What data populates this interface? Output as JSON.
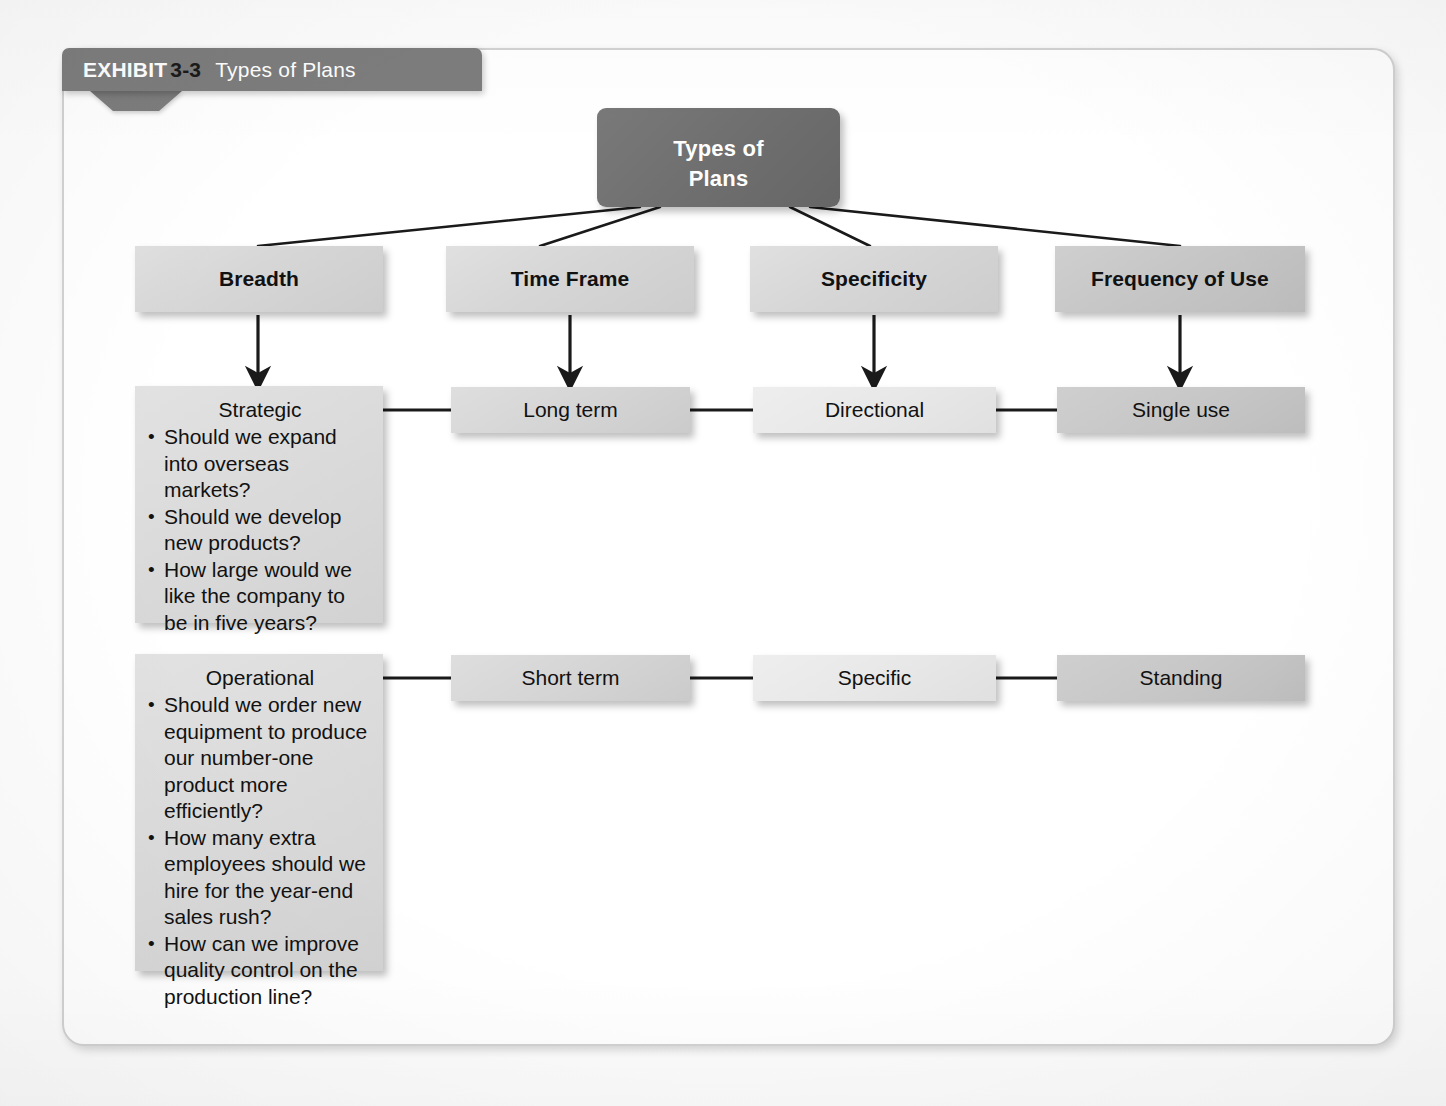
{
  "exhibit": {
    "label": "EXHIBIT",
    "number": "3-3",
    "title": "Types of Plans"
  },
  "diagram": {
    "type": "hierarchy-matrix",
    "root": {
      "label": "Types of\nPlans",
      "line1": "Types of",
      "line2": "Plans"
    },
    "columns": [
      {
        "heading": "Breadth",
        "shade": "#d6d6d6"
      },
      {
        "heading": "Time Frame",
        "shade": "#d6d6d6"
      },
      {
        "heading": "Specificity",
        "shade": "#d6d6d6"
      },
      {
        "heading": "Frequency of Use",
        "shade": "#c6c6c6"
      }
    ],
    "rows": [
      {
        "name": "strategic-row",
        "cells": [
          {
            "title": "Strategic",
            "bullets": [
              "Should we expand into overseas markets?",
              "Should we develop new products?",
              "How large would we like the company to be in five years?"
            ]
          },
          {
            "title": "Long term",
            "shade": "#d5d5d5"
          },
          {
            "title": "Directional",
            "shade": "#e8e8e8"
          },
          {
            "title": "Single use",
            "shade": "#c7c7c7"
          }
        ]
      },
      {
        "name": "operational-row",
        "cells": [
          {
            "title": "Operational",
            "bullets": [
              "Should we order new equipment to produce our number-one product more efficiently?",
              "How many extra employees should we hire for the year-end sales rush?",
              "How can we improve quality control on the production line?"
            ]
          },
          {
            "title": "Short term",
            "shade": "#d5d5d5"
          },
          {
            "title": "Specific",
            "shade": "#e8e8e8"
          },
          {
            "title": "Standing",
            "shade": "#c7c7c7"
          }
        ]
      }
    ],
    "colors": {
      "root_fill": "#6e6e6e",
      "root_text": "#ffffff",
      "banner_fill": "#7d7d7d",
      "banner_text": "#ffffff",
      "banner_number_text": "#1a1a1a",
      "connector": "#1a1a1a",
      "frame_border": "#d2d2d2",
      "page_background": "#ffffff"
    }
  }
}
